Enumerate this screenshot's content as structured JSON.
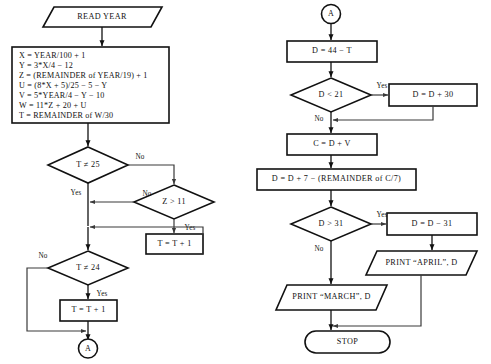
{
  "diagram": {
    "type": "flowchart"
  },
  "left_column": {
    "read_year": "READ YEAR",
    "process_lines": [
      "X  =  YEAR/100 + 1",
      "Y  =  3*X/4  −  12",
      "Z  =  (REMAINDER of YEAR/19) + 1",
      "U  =  (8*X + 5)/25 − 5 − Y",
      "V  =  5*YEAR/4 − Y − 10",
      "W  =  11*Z + 20 + U",
      "T  =  REMAINDER of W/30"
    ],
    "decision_t25": "T ≠ 25",
    "decision_z11": "Z > 11",
    "decision_t24": "T ≠ 24",
    "process_tplus1_a": "T = T + 1",
    "process_tplus1_b": "T = T + 1",
    "connector_a_out": "A",
    "labels": {
      "t25_no": "No",
      "t25_yes": "Yes",
      "z11_no": "No",
      "z11_yes": "Yes",
      "t24_no": "No",
      "t24_yes": "Yes"
    }
  },
  "right_column": {
    "connector_a_in": "A",
    "process_d44": "D = 44 − T",
    "decision_d21": "D < 21",
    "process_dplus30": "D = D + 30",
    "process_cdv": "C = D + V",
    "process_d7": "D = D + 7 − (REMAINDER of C/7)",
    "decision_d31": "D > 31",
    "process_dminus31": "D = D − 31",
    "print_april": "PRINT “APRIL”, D",
    "print_march": "PRINT “MARCH”, D",
    "stop": "STOP",
    "labels": {
      "d21_yes": "Yes",
      "d21_no": "No",
      "d31_yes": "Yes",
      "d31_no": "No"
    }
  },
  "colors": {
    "shape_stroke": "#111111",
    "connector_stroke": "#3a3a3a",
    "background": "#ffffff",
    "text": "#111111"
  }
}
